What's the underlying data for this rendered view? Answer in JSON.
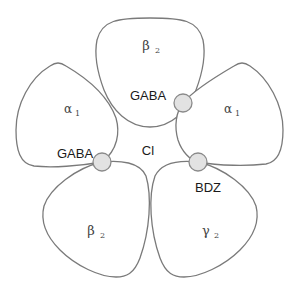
{
  "diagram": {
    "colors": {
      "outline": "#7a7a7a",
      "binding_site_fill": "#e2e2e2",
      "text": "#1a1a1a"
    },
    "subunits": [
      {
        "id": "top",
        "symbol": "β",
        "subscript": "2"
      },
      {
        "id": "upper-right",
        "symbol": "α",
        "subscript": "1"
      },
      {
        "id": "lower-right",
        "symbol": "γ",
        "subscript": "2"
      },
      {
        "id": "lower-left",
        "symbol": "β",
        "subscript": "2"
      },
      {
        "id": "upper-left",
        "symbol": "α",
        "subscript": "1"
      }
    ],
    "binding_sites": [
      {
        "id": "gaba-site-1",
        "label": "GABA",
        "between": "top / upper-right"
      },
      {
        "id": "gaba-site-2",
        "label": "GABA",
        "between": "upper-left / lower-left"
      },
      {
        "id": "bdz-site",
        "label": "BDZ",
        "between": "upper-right / lower-right"
      }
    ],
    "channel": {
      "label": "Cl"
    }
  }
}
